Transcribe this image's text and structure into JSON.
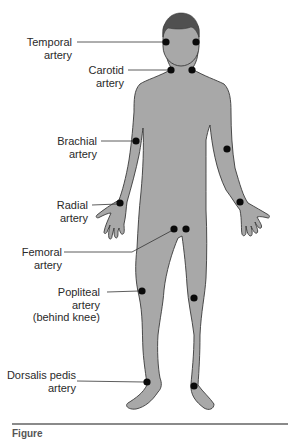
{
  "figure": {
    "colors": {
      "body": "#a8a8a8",
      "outline": "#3a3a3a",
      "hair": "#505050",
      "dot": "#0a0a0a",
      "leader": "#333333"
    },
    "labels": [
      {
        "id": "temporal",
        "line1": "Temporal",
        "line2": "artery"
      },
      {
        "id": "carotid",
        "line1": "Carotid",
        "line2": "artery"
      },
      {
        "id": "brachial",
        "line1": "Brachial",
        "line2": "artery"
      },
      {
        "id": "radial",
        "line1": "Radial",
        "line2": "artery"
      },
      {
        "id": "femoral",
        "line1": "Femoral",
        "line2": "artery"
      },
      {
        "id": "popliteal",
        "line1": "Popliteal",
        "line2": "artery",
        "line3": "(behind knee)"
      },
      {
        "id": "dorsalis-pedis",
        "line1": "Dorsalis pedis",
        "line2": "artery"
      }
    ],
    "pulse_points": [
      {
        "name": "temporal-left",
        "x": 166,
        "y": 42
      },
      {
        "name": "temporal-right",
        "x": 196,
        "y": 42
      },
      {
        "name": "carotid-left",
        "x": 171,
        "y": 70
      },
      {
        "name": "carotid-right",
        "x": 192,
        "y": 70
      },
      {
        "name": "brachial-left",
        "x": 136,
        "y": 141
      },
      {
        "name": "brachial-right",
        "x": 227,
        "y": 149
      },
      {
        "name": "radial-left",
        "x": 120,
        "y": 203
      },
      {
        "name": "radial-right",
        "x": 240,
        "y": 202
      },
      {
        "name": "femoral-left",
        "x": 174,
        "y": 229
      },
      {
        "name": "femoral-right",
        "x": 186,
        "y": 229
      },
      {
        "name": "popliteal-left",
        "x": 142,
        "y": 291
      },
      {
        "name": "popliteal-right",
        "x": 194,
        "y": 298
      },
      {
        "name": "dorsalis-pedis-left",
        "x": 147,
        "y": 382
      },
      {
        "name": "dorsalis-pedis-right",
        "x": 194,
        "y": 386
      }
    ],
    "caption": "Figure"
  }
}
